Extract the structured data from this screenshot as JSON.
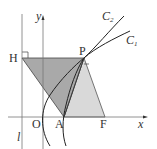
{
  "diagram": {
    "type": "conic-geometry",
    "axes": {
      "x_label": "x",
      "y_label": "y",
      "origin_label": "O"
    },
    "line_label": "l",
    "points": {
      "H": "H",
      "P": "P",
      "A": "A",
      "F": "F"
    },
    "curves": [
      {
        "name": "C",
        "sub": "2"
      },
      {
        "name": "C",
        "sub": "1"
      }
    ],
    "colors": {
      "dark_fill": "#a9a9a9",
      "light_fill": "#d9d9d9",
      "stroke": "#333333",
      "axis": "#777777"
    }
  }
}
